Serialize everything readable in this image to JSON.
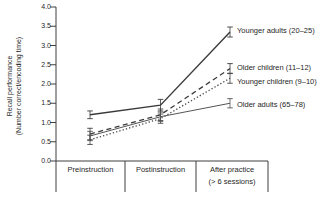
{
  "chart_data": {
    "type": "line",
    "title": "",
    "ylabel": "Recall performance (Number correct/encoding time)",
    "ylabel_line1": "Recall performance",
    "ylabel_line2": "(Number correct/encoding time)",
    "ylim": [
      0,
      4
    ],
    "ytick_step": 0.5,
    "yticks": [
      "4.0",
      "3.5",
      "3.0",
      "2.5",
      "2.0",
      "1.5",
      "1.0",
      "0.5",
      "0.0"
    ],
    "categories": [
      {
        "line1": "Preinstruction",
        "line2": ""
      },
      {
        "line1": "Postinstruction",
        "line2": ""
      },
      {
        "line1": "After practice",
        "line2": "(> 6 sessions)"
      }
    ],
    "grid": false,
    "legend_position": "right-of-line-ends",
    "error_bars": true,
    "series": [
      {
        "name": "Younger adults (20–25)",
        "values": [
          1.2,
          1.45,
          3.35
        ],
        "errors": [
          0.1,
          0.15,
          0.13
        ],
        "line_style": "solid",
        "color": "#3a3a3a",
        "width": 1.4
      },
      {
        "name": "Older children (11–12)",
        "values": [
          0.7,
          1.2,
          2.4
        ],
        "errors": [
          0.15,
          0.15,
          0.13
        ],
        "line_style": "dashed",
        "color": "#3a3a3a",
        "width": 1.3
      },
      {
        "name": "Younger children (9–10)",
        "values": [
          0.55,
          1.1,
          2.15
        ],
        "errors": [
          0.12,
          0.12,
          0.13
        ],
        "line_style": "dotted",
        "color": "#454545",
        "width": 1.3
      },
      {
        "name": "Older adults (65–78)",
        "values": [
          0.65,
          1.15,
          1.5
        ],
        "errors": [
          0.12,
          0.12,
          0.12
        ],
        "line_style": "solid",
        "color": "#555555",
        "width": 1.0
      }
    ],
    "colors": {
      "axis": "#3f3f3f",
      "text": "#1f1f1f",
      "background": "#ffffff"
    }
  }
}
